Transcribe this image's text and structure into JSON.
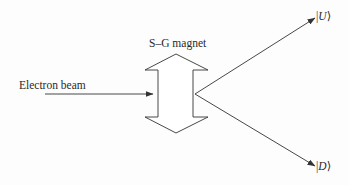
{
  "diagram": {
    "labels": {
      "input_beam": "Electron beam",
      "magnet": "S–G magnet"
    },
    "outputs": [
      {
        "name": "up",
        "bar": "|",
        "symbol": "U",
        "angle": "⟩"
      },
      {
        "name": "down",
        "bar": "|",
        "symbol": "D",
        "angle": "⟩"
      }
    ],
    "colors": {
      "line": "#333333",
      "text": "#2a2a2a",
      "background": "#fdfdfd"
    },
    "geometry": {
      "input_arrow": {
        "x1": 45,
        "y1": 94,
        "x2": 153,
        "y2": 94
      },
      "magnet_polygon": "176,54 208,70 193,70 193,117 208,117 176,133 145,117 158,117 158,70 145,70",
      "split_vertex": {
        "x": 195,
        "y": 94
      },
      "up_arrow_tip": {
        "x": 315,
        "y": 18
      },
      "down_arrow_tip": {
        "x": 315,
        "y": 166
      }
    }
  }
}
